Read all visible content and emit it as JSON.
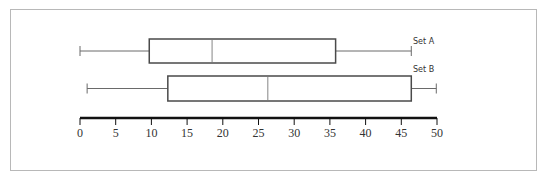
{
  "chart_data": {
    "type": "boxplot",
    "title": "",
    "xlabel": "",
    "ylabel": "",
    "orientation": "horizontal",
    "axis": {
      "min": 0,
      "max": 50,
      "ticks": [
        0,
        5,
        10,
        15,
        20,
        25,
        30,
        35,
        40,
        45,
        50
      ],
      "tick_labels": [
        "0",
        "5",
        "10",
        "15",
        "20",
        "25",
        "30",
        "35",
        "40",
        "45",
        "50"
      ]
    },
    "grid": false,
    "legend": "none",
    "series": [
      {
        "name": "Set A",
        "min": 0,
        "q1": 9.7,
        "median": 18.5,
        "q3": 35.8,
        "max": 46.4
      },
      {
        "name": "Set B",
        "min": 1,
        "q1": 12.3,
        "median": 26.3,
        "q3": 46.4,
        "max": 49.9
      }
    ]
  },
  "labels": {
    "set_a": "Set A",
    "set_b": "Set B"
  },
  "colors": {
    "box_stroke": "#4a4a4a",
    "whisker": "#6a6a6a",
    "median": "#9a9a9a",
    "axis": "#111111",
    "frame": "#b8b8b8"
  }
}
